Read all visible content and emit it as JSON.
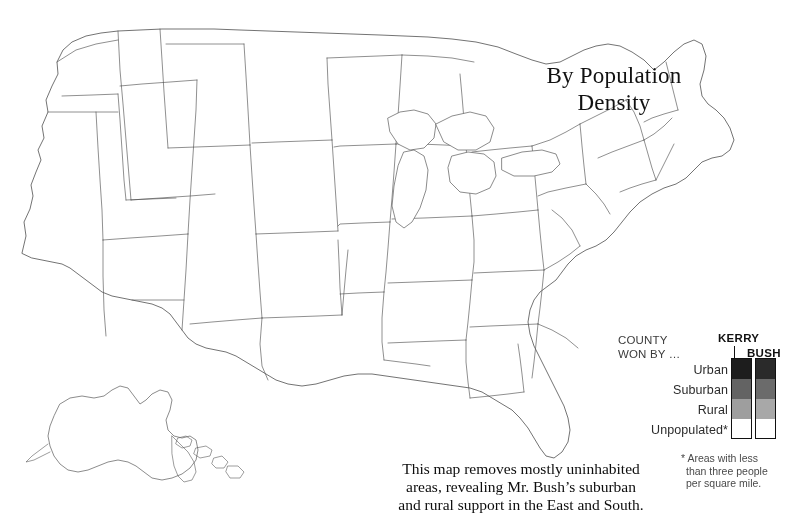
{
  "title": {
    "line1": "By Population",
    "line2": "Density"
  },
  "caption": {
    "line1": "This map removes mostly uninhabited",
    "line2": "areas, revealing Mr. Bush’s suburban",
    "line3": "and rural support in the East and South."
  },
  "legend": {
    "county_line1": "COUNTY",
    "county_line2": "WON BY …",
    "kerry_label": "KERRY",
    "bush_label": "BUSH",
    "rows": [
      "Urban",
      "Suburban",
      "Rural",
      "Unpopulated*"
    ],
    "kerry_swatches": [
      "#1d1d1d",
      "#636363",
      "#9e9e9e",
      "#ffffff"
    ],
    "bush_swatches": [
      "#2a2a2a",
      "#6b6b6b",
      "#a8a8a8",
      "#ffffff"
    ]
  },
  "footnote": {
    "line1": "* Areas with less",
    "line2": "than three people",
    "line3": "per square mile."
  },
  "colors": {
    "background": "#ffffff",
    "border": "#4a4a4a",
    "coastline": "#5a5a5a",
    "ink": "#111111"
  },
  "chart_data": {
    "type": "heatmap",
    "title": "By Population Density",
    "value_scale": [
      "Unpopulated*",
      "Rural",
      "Suburban",
      "Urban"
    ],
    "legend_position": "bottom-right",
    "grid": false,
    "series": [
      {
        "name": "KERRY",
        "swatches": [
          "#1d1d1d",
          "#636363",
          "#9e9e9e",
          "#ffffff"
        ]
      },
      {
        "name": "BUSH",
        "swatches": [
          "#2a2a2a",
          "#6b6b6b",
          "#a8a8a8",
          "#ffffff"
        ]
      }
    ],
    "density_field": {
      "base_east_of_100th_meridian": 0.42,
      "base_west_of_100th_meridian": 0.06,
      "units": "relative ink coverage 0-1"
    },
    "urban_centers": [
      {
        "name": "Seattle",
        "x": 63,
        "y": 47,
        "r": 17,
        "w": 0.92
      },
      {
        "name": "Portland",
        "x": 48,
        "y": 86,
        "r": 14,
        "w": 0.85
      },
      {
        "name": "San Francisco Bay",
        "x": 29,
        "y": 247,
        "r": 15,
        "w": 0.97
      },
      {
        "name": "Sacramento",
        "x": 41,
        "y": 232,
        "r": 11,
        "w": 0.7
      },
      {
        "name": "Fresno",
        "x": 50,
        "y": 270,
        "r": 9,
        "w": 0.6
      },
      {
        "name": "Los Angeles",
        "x": 73,
        "y": 303,
        "r": 20,
        "w": 1.0
      },
      {
        "name": "San Diego",
        "x": 82,
        "y": 325,
        "r": 12,
        "w": 0.82
      },
      {
        "name": "Las Vegas",
        "x": 103,
        "y": 276,
        "r": 10,
        "w": 0.72
      },
      {
        "name": "Phoenix",
        "x": 132,
        "y": 312,
        "r": 14,
        "w": 0.85
      },
      {
        "name": "Tucson",
        "x": 146,
        "y": 332,
        "r": 9,
        "w": 0.6
      },
      {
        "name": "Salt Lake City",
        "x": 141,
        "y": 190,
        "r": 11,
        "w": 0.74
      },
      {
        "name": "Boise",
        "x": 113,
        "y": 140,
        "r": 8,
        "w": 0.55
      },
      {
        "name": "Spokane",
        "x": 110,
        "y": 48,
        "r": 8,
        "w": 0.5
      },
      {
        "name": "Denver",
        "x": 196,
        "y": 226,
        "r": 14,
        "w": 0.86
      },
      {
        "name": "Albuquerque",
        "x": 173,
        "y": 290,
        "r": 9,
        "w": 0.6
      },
      {
        "name": "El Paso",
        "x": 180,
        "y": 330,
        "r": 9,
        "w": 0.62
      },
      {
        "name": "Billings",
        "x": 172,
        "y": 108,
        "r": 6,
        "w": 0.38
      },
      {
        "name": "Wichita",
        "x": 282,
        "y": 254,
        "r": 9,
        "w": 0.6
      },
      {
        "name": "Kansas City",
        "x": 316,
        "y": 234,
        "r": 12,
        "w": 0.76
      },
      {
        "name": "Omaha",
        "x": 291,
        "y": 204,
        "r": 9,
        "w": 0.62
      },
      {
        "name": "Minneapolis",
        "x": 330,
        "y": 137,
        "r": 14,
        "w": 0.86
      },
      {
        "name": "Des Moines",
        "x": 325,
        "y": 200,
        "r": 8,
        "w": 0.55
      },
      {
        "name": "St. Louis",
        "x": 371,
        "y": 243,
        "r": 13,
        "w": 0.8
      },
      {
        "name": "Chicago",
        "x": 415,
        "y": 190,
        "r": 19,
        "w": 1.0
      },
      {
        "name": "Milwaukee",
        "x": 400,
        "y": 169,
        "r": 10,
        "w": 0.68
      },
      {
        "name": "Indianapolis",
        "x": 438,
        "y": 222,
        "r": 11,
        "w": 0.7
      },
      {
        "name": "Detroit",
        "x": 470,
        "y": 181,
        "r": 16,
        "w": 0.93
      },
      {
        "name": "Cleveland",
        "x": 492,
        "y": 191,
        "r": 13,
        "w": 0.82
      },
      {
        "name": "Columbus",
        "x": 478,
        "y": 212,
        "r": 11,
        "w": 0.72
      },
      {
        "name": "Cincinnati",
        "x": 460,
        "y": 231,
        "r": 11,
        "w": 0.72
      },
      {
        "name": "Louisville",
        "x": 447,
        "y": 250,
        "r": 9,
        "w": 0.62
      },
      {
        "name": "Nashville",
        "x": 437,
        "y": 281,
        "r": 10,
        "w": 0.66
      },
      {
        "name": "Memphis",
        "x": 388,
        "y": 293,
        "r": 10,
        "w": 0.68
      },
      {
        "name": "Pittsburgh",
        "x": 517,
        "y": 204,
        "r": 12,
        "w": 0.76
      },
      {
        "name": "Buffalo",
        "x": 538,
        "y": 163,
        "r": 9,
        "w": 0.62
      },
      {
        "name": "Rochester",
        "x": 548,
        "y": 152,
        "r": 8,
        "w": 0.55
      },
      {
        "name": "Philadelphia",
        "x": 584,
        "y": 215,
        "r": 16,
        "w": 0.95
      },
      {
        "name": "New York",
        "x": 600,
        "y": 190,
        "r": 22,
        "w": 1.0
      },
      {
        "name": "Newark",
        "x": 594,
        "y": 197,
        "r": 12,
        "w": 0.85
      },
      {
        "name": "Hartford",
        "x": 613,
        "y": 172,
        "r": 9,
        "w": 0.68
      },
      {
        "name": "Boston",
        "x": 628,
        "y": 158,
        "r": 15,
        "w": 0.93
      },
      {
        "name": "Providence",
        "x": 623,
        "y": 170,
        "r": 9,
        "w": 0.7
      },
      {
        "name": "Baltimore",
        "x": 566,
        "y": 228,
        "r": 12,
        "w": 0.8
      },
      {
        "name": "Washington DC",
        "x": 556,
        "y": 236,
        "r": 13,
        "w": 0.85
      },
      {
        "name": "Richmond",
        "x": 551,
        "y": 258,
        "r": 9,
        "w": 0.62
      },
      {
        "name": "Norfolk",
        "x": 567,
        "y": 268,
        "r": 10,
        "w": 0.68
      },
      {
        "name": "Raleigh",
        "x": 535,
        "y": 283,
        "r": 9,
        "w": 0.6
      },
      {
        "name": "Charlotte",
        "x": 512,
        "y": 291,
        "r": 10,
        "w": 0.66
      },
      {
        "name": "Atlanta",
        "x": 476,
        "y": 310,
        "r": 14,
        "w": 0.86
      },
      {
        "name": "Birmingham",
        "x": 441,
        "y": 312,
        "r": 9,
        "w": 0.6
      },
      {
        "name": "New Orleans",
        "x": 390,
        "y": 368,
        "r": 11,
        "w": 0.74
      },
      {
        "name": "Baton Rouge",
        "x": 378,
        "y": 356,
        "r": 8,
        "w": 0.55
      },
      {
        "name": "Houston",
        "x": 330,
        "y": 372,
        "r": 15,
        "w": 0.9
      },
      {
        "name": "San Antonio",
        "x": 287,
        "y": 372,
        "r": 12,
        "w": 0.78
      },
      {
        "name": "Austin",
        "x": 293,
        "y": 355,
        "r": 10,
        "w": 0.66
      },
      {
        "name": "Dallas",
        "x": 310,
        "y": 324,
        "r": 16,
        "w": 0.92
      },
      {
        "name": "Oklahoma City",
        "x": 285,
        "y": 292,
        "r": 10,
        "w": 0.66
      },
      {
        "name": "Tulsa",
        "x": 305,
        "y": 278,
        "r": 9,
        "w": 0.6
      },
      {
        "name": "Little Rock",
        "x": 358,
        "y": 300,
        "r": 8,
        "w": 0.55
      },
      {
        "name": "Jacksonville",
        "x": 527,
        "y": 368,
        "r": 10,
        "w": 0.66
      },
      {
        "name": "Orlando",
        "x": 538,
        "y": 396,
        "r": 11,
        "w": 0.72
      },
      {
        "name": "Tampa",
        "x": 524,
        "y": 404,
        "r": 12,
        "w": 0.78
      },
      {
        "name": "Miami",
        "x": 560,
        "y": 444,
        "r": 14,
        "w": 0.9
      },
      {
        "name": "Honolulu",
        "x": 196,
        "y": 452,
        "r": 7,
        "w": 0.8
      }
    ]
  }
}
